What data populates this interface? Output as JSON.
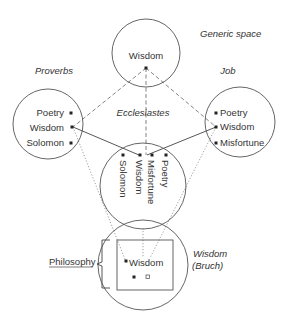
{
  "diagram": {
    "type": "conceptual-blending-network",
    "spaces": {
      "generic": {
        "title": "Generic space",
        "items": [
          "Wisdom"
        ]
      },
      "proverbs": {
        "title": "Proverbs",
        "items": [
          "Poetry",
          "Wisdom",
          "Solomon"
        ]
      },
      "job": {
        "title": "Job",
        "items": [
          "Poetry",
          "Wisdom",
          "Misfortune"
        ]
      },
      "ecclesiastes": {
        "title": "Ecclesiastes",
        "items": [
          "Poetry",
          "Misfortune",
          "Wisdom",
          "Solomon"
        ]
      },
      "blend": {
        "title_line1": "Wisdom",
        "title_line2": "(Bruch)",
        "items": [
          "Wisdom"
        ],
        "emergent_label": "Philosophy"
      }
    },
    "connections": [
      {
        "from": "generic.Wisdom",
        "to": "proverbs.Wisdom",
        "style": "dashed"
      },
      {
        "from": "generic.Wisdom",
        "to": "job.Wisdom",
        "style": "dashed"
      },
      {
        "from": "generic.Wisdom",
        "to": "ecclesiastes.Wisdom",
        "style": "dashed"
      },
      {
        "from": "proverbs.Wisdom",
        "to": "ecclesiastes.Wisdom",
        "style": "solid"
      },
      {
        "from": "job.Wisdom",
        "to": "ecclesiastes.Wisdom",
        "style": "solid"
      },
      {
        "from": "proverbs.Wisdom",
        "to": "blend.Wisdom",
        "style": "dotted"
      },
      {
        "from": "job.Wisdom",
        "to": "blend.Wisdom",
        "style": "dotted"
      },
      {
        "from": "ecclesiastes.Wisdom",
        "to": "blend.Wisdom",
        "style": "dotted"
      }
    ]
  }
}
